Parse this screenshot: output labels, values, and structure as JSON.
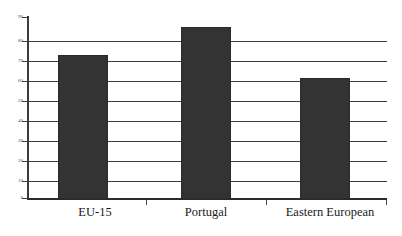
{
  "chart_data": {
    "type": "bar",
    "title": "",
    "subtitle": "",
    "xlabel": "",
    "ylabel": "",
    "categories": [
      "EU-15",
      "Portugal",
      "Eastern European"
    ],
    "values": [
      71,
      85,
      60
    ],
    "series": [
      {
        "name": "",
        "values": [
          71,
          85,
          60
        ]
      }
    ],
    "ylim": [
      0,
      90
    ],
    "ytick_labels": [
      "90",
      "80",
      "70",
      "60",
      "50",
      "40",
      "30",
      "20",
      "10",
      "0"
    ],
    "ytick_values": [
      90,
      80,
      70,
      60,
      50,
      40,
      30,
      20,
      10,
      0
    ],
    "ytick_step": 10,
    "grid": true,
    "grid_axis": "y",
    "legend": false,
    "legend_position": "none",
    "annotations": [],
    "bar_color": "#333333",
    "bar_edge_color": "#2a2a2a",
    "axis_color": "#3a3a3a",
    "grid_color": "#3c3c3c",
    "background_color": "#ffffff",
    "text_color": "#1a1a1a"
  }
}
